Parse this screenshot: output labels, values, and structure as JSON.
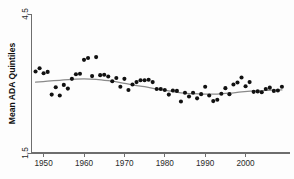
{
  "chart_data": {
    "type": "scatter",
    "title": "",
    "subtitle": "",
    "xlabel": "",
    "ylabel": "Mean ADA Quintiles",
    "xlim": [
      1947,
      2011
    ],
    "ylim": [
      1.5,
      4.5
    ],
    "grid": false,
    "legend": null,
    "x_ticks": [
      1950,
      1960,
      1970,
      1980,
      1990,
      2000
    ],
    "x_tick_labels": [
      "1950",
      "1960",
      "1970",
      "1980",
      "1990",
      "2000"
    ],
    "y_ticks": [
      1.5,
      4.5
    ],
    "y_tick_labels": [
      "1.5",
      "4.5"
    ],
    "marker_color": "#111111",
    "fit_line_color": "#8a8a8a",
    "axis_color": "#6e6e6e",
    "background_color": "#fdfdfd",
    "series": [
      {
        "name": "Mean ADA Quintiles",
        "type": "scatter",
        "points": [
          {
            "x": 1948,
            "y": 3.26
          },
          {
            "x": 1949,
            "y": 3.33
          },
          {
            "x": 1950,
            "y": 3.22
          },
          {
            "x": 1951,
            "y": 3.25
          },
          {
            "x": 1952,
            "y": 2.76
          },
          {
            "x": 1953,
            "y": 2.92
          },
          {
            "x": 1954,
            "y": 2.74
          },
          {
            "x": 1955,
            "y": 2.97
          },
          {
            "x": 1956,
            "y": 2.89
          },
          {
            "x": 1957,
            "y": 3.1
          },
          {
            "x": 1958,
            "y": 3.2
          },
          {
            "x": 1959,
            "y": 3.21
          },
          {
            "x": 1960,
            "y": 3.51
          },
          {
            "x": 1961,
            "y": 3.55
          },
          {
            "x": 1962,
            "y": 3.16
          },
          {
            "x": 1963,
            "y": 3.57
          },
          {
            "x": 1964,
            "y": 3.18
          },
          {
            "x": 1965,
            "y": 3.19
          },
          {
            "x": 1966,
            "y": 3.15
          },
          {
            "x": 1967,
            "y": 3.05
          },
          {
            "x": 1968,
            "y": 3.12
          },
          {
            "x": 1969,
            "y": 2.93
          },
          {
            "x": 1970,
            "y": 3.1
          },
          {
            "x": 1971,
            "y": 2.86
          },
          {
            "x": 1972,
            "y": 2.98
          },
          {
            "x": 1973,
            "y": 3.03
          },
          {
            "x": 1974,
            "y": 3.07
          },
          {
            "x": 1975,
            "y": 3.07
          },
          {
            "x": 1976,
            "y": 3.08
          },
          {
            "x": 1977,
            "y": 3.03
          },
          {
            "x": 1978,
            "y": 2.88
          },
          {
            "x": 1979,
            "y": 2.88
          },
          {
            "x": 1980,
            "y": 2.86
          },
          {
            "x": 1981,
            "y": 2.76
          },
          {
            "x": 1982,
            "y": 2.85
          },
          {
            "x": 1983,
            "y": 2.84
          },
          {
            "x": 1984,
            "y": 2.61
          },
          {
            "x": 1985,
            "y": 2.8
          },
          {
            "x": 1986,
            "y": 2.72
          },
          {
            "x": 1987,
            "y": 2.8
          },
          {
            "x": 1988,
            "y": 2.68
          },
          {
            "x": 1989,
            "y": 2.77
          },
          {
            "x": 1990,
            "y": 2.93
          },
          {
            "x": 1991,
            "y": 2.74
          },
          {
            "x": 1992,
            "y": 2.62
          },
          {
            "x": 1993,
            "y": 2.65
          },
          {
            "x": 1994,
            "y": 2.78
          },
          {
            "x": 1995,
            "y": 2.9
          },
          {
            "x": 1996,
            "y": 2.77
          },
          {
            "x": 1997,
            "y": 2.98
          },
          {
            "x": 1998,
            "y": 3.02
          },
          {
            "x": 1999,
            "y": 3.13
          },
          {
            "x": 2000,
            "y": 2.94
          },
          {
            "x": 2001,
            "y": 3.03
          },
          {
            "x": 2002,
            "y": 2.82
          },
          {
            "x": 2003,
            "y": 2.83
          },
          {
            "x": 2004,
            "y": 2.81
          },
          {
            "x": 2005,
            "y": 2.88
          },
          {
            "x": 2006,
            "y": 2.91
          },
          {
            "x": 2007,
            "y": 2.84
          },
          {
            "x": 2008,
            "y": 2.85
          },
          {
            "x": 2009,
            "y": 2.93
          }
        ]
      },
      {
        "name": "Smoothed fit",
        "type": "line",
        "points": [
          {
            "x": 1948,
            "y": 3.03
          },
          {
            "x": 1951,
            "y": 3.05
          },
          {
            "x": 1954,
            "y": 3.07
          },
          {
            "x": 1957,
            "y": 3.09
          },
          {
            "x": 1960,
            "y": 3.1
          },
          {
            "x": 1963,
            "y": 3.09
          },
          {
            "x": 1966,
            "y": 3.06
          },
          {
            "x": 1969,
            "y": 3.02
          },
          {
            "x": 1972,
            "y": 2.97
          },
          {
            "x": 1975,
            "y": 2.93
          },
          {
            "x": 1978,
            "y": 2.88
          },
          {
            "x": 1981,
            "y": 2.84
          },
          {
            "x": 1984,
            "y": 2.8
          },
          {
            "x": 1987,
            "y": 2.78
          },
          {
            "x": 1990,
            "y": 2.77
          },
          {
            "x": 1993,
            "y": 2.77
          },
          {
            "x": 1996,
            "y": 2.79
          },
          {
            "x": 1999,
            "y": 2.82
          },
          {
            "x": 2002,
            "y": 2.84
          },
          {
            "x": 2005,
            "y": 2.85
          },
          {
            "x": 2009,
            "y": 2.86
          }
        ]
      }
    ]
  }
}
